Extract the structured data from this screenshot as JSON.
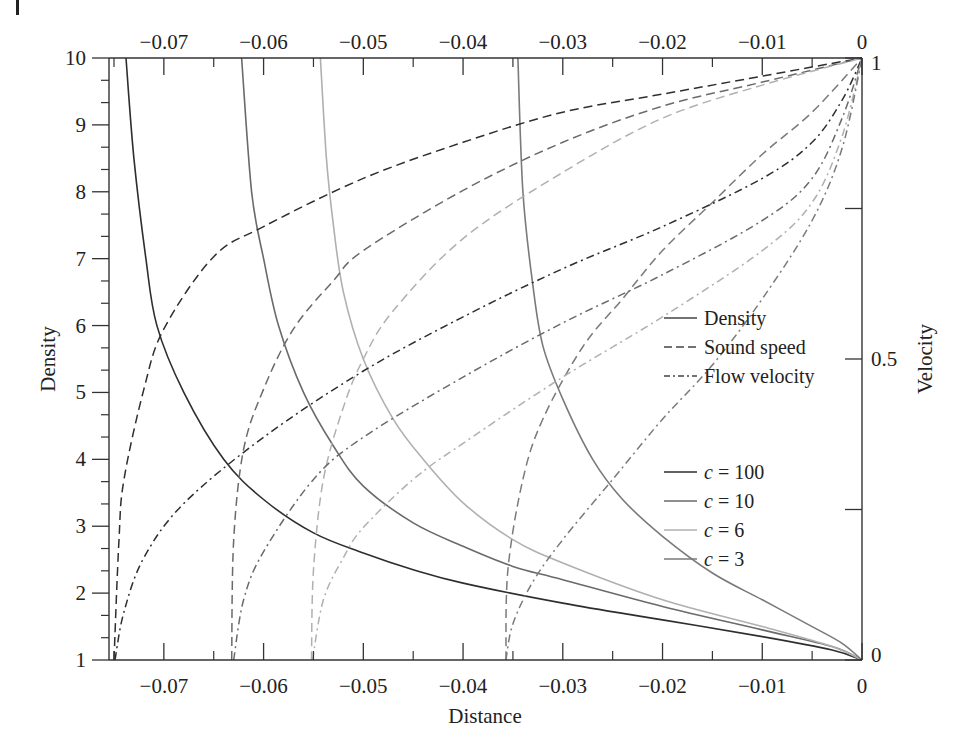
{
  "chart_data": {
    "type": "line",
    "title": "",
    "xlabel": "Distance",
    "ylabel": "Density",
    "y2label": "Velocity",
    "xlim": [
      -0.0755,
      0
    ],
    "ylim": [
      1,
      10
    ],
    "y2lim": [
      0,
      1
    ],
    "grid": false,
    "legend_position": "center-right",
    "x_ticks": [
      -0.07,
      -0.06,
      -0.05,
      -0.04,
      -0.03,
      -0.02,
      -0.01,
      0
    ],
    "x_tick_labels": [
      "−0.07",
      "−0.06",
      "−0.05",
      "−0.04",
      "−0.03",
      "−0.02",
      "−0.01",
      "0"
    ],
    "y_ticks": [
      1,
      2,
      3,
      4,
      5,
      6,
      7,
      8,
      9,
      10
    ],
    "y_tick_labels": [
      "1",
      "2",
      "3",
      "4",
      "5",
      "6",
      "7",
      "8",
      "9",
      "10"
    ],
    "y2_ticks": [
      0,
      0.25,
      0.5,
      0.75,
      1
    ],
    "y2_tick_labels": [
      "0",
      "",
      "0.5",
      "",
      "1"
    ],
    "legend_styles": [
      {
        "label": "Density",
        "dash": "solid"
      },
      {
        "label": "Sound speed",
        "dash": "dashed"
      },
      {
        "label": "Flow velocity",
        "dash": "dashdot"
      }
    ],
    "legend_cases": [
      {
        "label_c": "c",
        "label_eq": " = 100",
        "color": "#2e2e2e"
      },
      {
        "label_c": "c",
        "label_eq": " = 10",
        "color": "#6a6a6a"
      },
      {
        "label_c": "c",
        "label_eq": " = 6",
        "color": "#b0b0b0"
      },
      {
        "label_c": "c",
        "label_eq": " = 3",
        "color": "#7a7a7a"
      }
    ],
    "series": [
      {
        "name": "Density c=100",
        "quantity": "density",
        "axis": "left",
        "dash": "solid",
        "color": "#2e2e2e",
        "points": [
          [
            -0.0738,
            10
          ],
          [
            -0.073,
            8.5
          ],
          [
            -0.0718,
            7
          ],
          [
            -0.0707,
            6
          ],
          [
            -0.068,
            5
          ],
          [
            -0.064,
            4
          ],
          [
            -0.06,
            3.4
          ],
          [
            -0.055,
            2.9
          ],
          [
            -0.05,
            2.6
          ],
          [
            -0.045,
            2.35
          ],
          [
            -0.04,
            2.15
          ],
          [
            -0.03,
            1.85
          ],
          [
            -0.02,
            1.6
          ],
          [
            -0.01,
            1.35
          ],
          [
            -0.003,
            1.15
          ],
          [
            0,
            1
          ]
        ]
      },
      {
        "name": "Density c=10",
        "quantity": "density",
        "axis": "left",
        "dash": "solid",
        "color": "#6a6a6a",
        "points": [
          [
            -0.0622,
            10
          ],
          [
            -0.0612,
            8
          ],
          [
            -0.06,
            7
          ],
          [
            -0.0585,
            6
          ],
          [
            -0.056,
            5
          ],
          [
            -0.053,
            4.2
          ],
          [
            -0.05,
            3.6
          ],
          [
            -0.045,
            3.05
          ],
          [
            -0.04,
            2.7
          ],
          [
            -0.035,
            2.4
          ],
          [
            -0.03,
            2.2
          ],
          [
            -0.02,
            1.8
          ],
          [
            -0.01,
            1.45
          ],
          [
            -0.003,
            1.2
          ],
          [
            0,
            1
          ]
        ]
      },
      {
        "name": "Density c=6",
        "quantity": "density",
        "axis": "left",
        "dash": "solid",
        "color": "#b0b0b0",
        "points": [
          [
            -0.0543,
            10
          ],
          [
            -0.0537,
            8.5
          ],
          [
            -0.053,
            7.5
          ],
          [
            -0.052,
            6.5
          ],
          [
            -0.05,
            5.5
          ],
          [
            -0.047,
            4.6
          ],
          [
            -0.044,
            4
          ],
          [
            -0.04,
            3.35
          ],
          [
            -0.035,
            2.8
          ],
          [
            -0.03,
            2.45
          ],
          [
            -0.02,
            1.9
          ],
          [
            -0.01,
            1.5
          ],
          [
            -0.003,
            1.2
          ],
          [
            0,
            1
          ]
        ]
      },
      {
        "name": "Density c=3",
        "quantity": "density",
        "axis": "left",
        "dash": "solid",
        "color": "#7a7a7a",
        "points": [
          [
            -0.0345,
            10
          ],
          [
            -0.034,
            8
          ],
          [
            -0.033,
            6.6
          ],
          [
            -0.032,
            5.7
          ],
          [
            -0.03,
            4.9
          ],
          [
            -0.027,
            4
          ],
          [
            -0.024,
            3.4
          ],
          [
            -0.02,
            2.85
          ],
          [
            -0.015,
            2.3
          ],
          [
            -0.01,
            1.9
          ],
          [
            -0.005,
            1.5
          ],
          [
            -0.002,
            1.25
          ],
          [
            0,
            1
          ]
        ]
      },
      {
        "name": "Sound speed c=100",
        "quantity": "sound_speed",
        "axis": "right",
        "dash": "dashed",
        "color": "#2e2e2e",
        "points": [
          [
            -0.075,
            0
          ],
          [
            -0.0745,
            0.2
          ],
          [
            -0.074,
            0.3
          ],
          [
            -0.072,
            0.45
          ],
          [
            -0.07,
            0.55
          ],
          [
            -0.065,
            0.67
          ],
          [
            -0.06,
            0.72
          ],
          [
            -0.05,
            0.8
          ],
          [
            -0.04,
            0.86
          ],
          [
            -0.03,
            0.91
          ],
          [
            -0.02,
            0.94
          ],
          [
            -0.01,
            0.97
          ],
          [
            0,
            1
          ]
        ]
      },
      {
        "name": "Sound speed c=10",
        "quantity": "sound_speed",
        "axis": "right",
        "dash": "dashed",
        "color": "#6a6a6a",
        "points": [
          [
            -0.0632,
            0
          ],
          [
            -0.063,
            0.2
          ],
          [
            -0.062,
            0.35
          ],
          [
            -0.06,
            0.45
          ],
          [
            -0.057,
            0.55
          ],
          [
            -0.053,
            0.63
          ],
          [
            -0.05,
            0.68
          ],
          [
            -0.04,
            0.78
          ],
          [
            -0.03,
            0.86
          ],
          [
            -0.02,
            0.92
          ],
          [
            -0.01,
            0.96
          ],
          [
            0,
            1
          ]
        ]
      },
      {
        "name": "Sound speed c=6",
        "quantity": "sound_speed",
        "axis": "right",
        "dash": "dashed",
        "color": "#b0b0b0",
        "points": [
          [
            -0.0552,
            0
          ],
          [
            -0.055,
            0.15
          ],
          [
            -0.054,
            0.3
          ],
          [
            -0.052,
            0.42
          ],
          [
            -0.05,
            0.5
          ],
          [
            -0.047,
            0.58
          ],
          [
            -0.04,
            0.7
          ],
          [
            -0.03,
            0.81
          ],
          [
            -0.02,
            0.9
          ],
          [
            -0.01,
            0.955
          ],
          [
            0,
            1
          ]
        ]
      },
      {
        "name": "Sound speed c=3",
        "quantity": "sound_speed",
        "axis": "right",
        "dash": "dashed",
        "color": "#7a7a7a",
        "points": [
          [
            -0.0357,
            0
          ],
          [
            -0.0355,
            0.15
          ],
          [
            -0.034,
            0.3
          ],
          [
            -0.032,
            0.4
          ],
          [
            -0.028,
            0.52
          ],
          [
            -0.024,
            0.6
          ],
          [
            -0.02,
            0.68
          ],
          [
            -0.015,
            0.76
          ],
          [
            -0.01,
            0.84
          ],
          [
            -0.005,
            0.91
          ],
          [
            0,
            1
          ]
        ]
      },
      {
        "name": "Flow velocity c=100",
        "quantity": "flow_velocity",
        "axis": "right",
        "dash": "dashdot",
        "color": "#2e2e2e",
        "points": [
          [
            -0.0749,
            0
          ],
          [
            -0.074,
            0.08
          ],
          [
            -0.072,
            0.17
          ],
          [
            -0.068,
            0.26
          ],
          [
            -0.06,
            0.37
          ],
          [
            -0.05,
            0.48
          ],
          [
            -0.04,
            0.57
          ],
          [
            -0.03,
            0.65
          ],
          [
            -0.02,
            0.72
          ],
          [
            -0.01,
            0.8
          ],
          [
            -0.005,
            0.86
          ],
          [
            -0.002,
            0.93
          ],
          [
            0,
            1
          ]
        ]
      },
      {
        "name": "Flow velocity c=10",
        "quantity": "flow_velocity",
        "axis": "right",
        "dash": "dashdot",
        "color": "#6a6a6a",
        "points": [
          [
            -0.063,
            0
          ],
          [
            -0.062,
            0.1
          ],
          [
            -0.06,
            0.18
          ],
          [
            -0.055,
            0.3
          ],
          [
            -0.05,
            0.37
          ],
          [
            -0.04,
            0.47
          ],
          [
            -0.03,
            0.56
          ],
          [
            -0.02,
            0.64
          ],
          [
            -0.01,
            0.73
          ],
          [
            -0.005,
            0.8
          ],
          [
            -0.002,
            0.9
          ],
          [
            0,
            1
          ]
        ]
      },
      {
        "name": "Flow velocity c=6",
        "quantity": "flow_velocity",
        "axis": "right",
        "dash": "dashdot",
        "color": "#b0b0b0",
        "points": [
          [
            -0.0551,
            0
          ],
          [
            -0.054,
            0.1
          ],
          [
            -0.052,
            0.17
          ],
          [
            -0.05,
            0.22
          ],
          [
            -0.045,
            0.3
          ],
          [
            -0.04,
            0.36
          ],
          [
            -0.03,
            0.47
          ],
          [
            -0.02,
            0.57
          ],
          [
            -0.01,
            0.68
          ],
          [
            -0.005,
            0.76
          ],
          [
            -0.002,
            0.87
          ],
          [
            0,
            1
          ]
        ]
      },
      {
        "name": "Flow velocity c=3",
        "quantity": "flow_velocity",
        "axis": "right",
        "dash": "dashdot",
        "color": "#7a7a7a",
        "points": [
          [
            -0.0357,
            0
          ],
          [
            -0.035,
            0.06
          ],
          [
            -0.033,
            0.13
          ],
          [
            -0.03,
            0.2
          ],
          [
            -0.025,
            0.3
          ],
          [
            -0.02,
            0.4
          ],
          [
            -0.015,
            0.49
          ],
          [
            -0.01,
            0.6
          ],
          [
            -0.005,
            0.73
          ],
          [
            -0.002,
            0.85
          ],
          [
            0,
            1
          ]
        ]
      }
    ]
  }
}
